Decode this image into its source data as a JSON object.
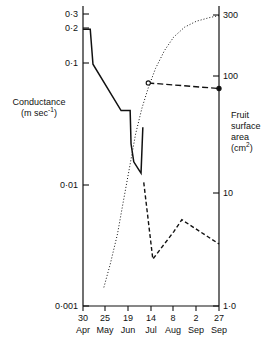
{
  "chart_data": {
    "type": "line",
    "title": "",
    "subtitle": "",
    "xlabel": "",
    "ylabel": "Conductance (m sec-1)",
    "y2label": "Fruit surface area (cm2)",
    "grid": false,
    "legend": "none",
    "x_axis": {
      "type": "date-category",
      "tick_days": [
        "30",
        "25",
        "19",
        "14",
        "8",
        "2",
        "27"
      ],
      "tick_months": [
        "Apr",
        "May",
        "Jun",
        "Jul",
        "Aug",
        "Sep",
        "Sep"
      ],
      "tick_labels": [
        "30 Apr",
        "25 May",
        "19 Jun",
        "14 Jul",
        "8 Aug",
        "2 Sep",
        "27 Sep"
      ],
      "range_days": [
        0,
        150
      ]
    },
    "y_left": {
      "scale": "log",
      "label_line1": "Conductance",
      "label_line2": "(m sec",
      "label_exp": "-1",
      "label_line2_end": ")",
      "tick_labels": [
        "0·3",
        "0·2",
        "0·1",
        "0·01",
        "0·001"
      ],
      "tick_values": [
        0.3,
        0.2,
        0.1,
        0.01,
        0.001
      ],
      "lim": [
        0.001,
        0.4
      ]
    },
    "y_right": {
      "scale": "log",
      "label_line1": "Fruit",
      "label_line2": "surface",
      "label_line3": "area",
      "label_line4": "(cm",
      "label_exp": "2",
      "label_line4_end": ")",
      "tick_labels": [
        "300",
        "100",
        "10",
        "1·0"
      ],
      "tick_values": [
        300,
        100,
        10,
        1.0
      ],
      "lim": [
        1.0,
        400
      ]
    },
    "series": [
      {
        "name": "Conductance (solid)",
        "style": "solid",
        "axis": "left",
        "points": [
          {
            "day": 0,
            "value": 0.252
          },
          {
            "day": 8,
            "value": 0.252
          },
          {
            "day": 11,
            "value": 0.125
          },
          {
            "day": 42,
            "value": 0.0495
          },
          {
            "day": 52,
            "value": 0.0495
          },
          {
            "day": 53,
            "value": 0.0255
          },
          {
            "day": 56,
            "value": 0.0178
          },
          {
            "day": 62,
            "value": 0.015
          },
          {
            "day": 64,
            "value": 0.0142
          },
          {
            "day": 66,
            "value": 0.0355
          }
        ]
      },
      {
        "name": "Conductance (dashed)",
        "style": "dashed",
        "axis": "left",
        "points": [
          {
            "day": 67,
            "value": 0.0118
          },
          {
            "day": 77,
            "value": 0.00255
          },
          {
            "day": 100,
            "value": 0.0044
          },
          {
            "day": 109,
            "value": 0.0056
          },
          {
            "day": 150,
            "value": 0.00345
          }
        ]
      },
      {
        "name": "Fruit surface area (dotted)",
        "style": "dotted",
        "axis": "right",
        "points": [
          {
            "day": 23,
            "value": 1.45
          },
          {
            "day": 30,
            "value": 2.3
          },
          {
            "day": 38,
            "value": 4.2
          },
          {
            "day": 45,
            "value": 8.5
          },
          {
            "day": 52,
            "value": 17
          },
          {
            "day": 58,
            "value": 31
          },
          {
            "day": 65,
            "value": 52
          },
          {
            "day": 72,
            "value": 78
          },
          {
            "day": 80,
            "value": 115
          },
          {
            "day": 90,
            "value": 165
          },
          {
            "day": 100,
            "value": 215
          },
          {
            "day": 112,
            "value": 262
          },
          {
            "day": 125,
            "value": 295
          },
          {
            "day": 140,
            "value": 318
          },
          {
            "day": 150,
            "value": 330
          }
        ]
      },
      {
        "name": "Fruit surface area (measured)",
        "style": "dash-marker",
        "axis": "right",
        "points": [
          {
            "day": 72,
            "value": 86,
            "marker": "open-circle"
          },
          {
            "day": 150,
            "value": 77,
            "marker": "filled-circle"
          }
        ]
      }
    ]
  }
}
